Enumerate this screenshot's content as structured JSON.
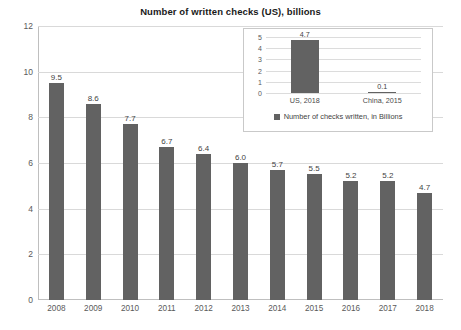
{
  "chart_data": {
    "type": "bar",
    "title": "Number of written checks (US), billions",
    "xlabel": "",
    "ylabel": "",
    "ylim": [
      0,
      12
    ],
    "yticks": [
      0,
      2,
      4,
      6,
      8,
      10,
      12
    ],
    "grid": true,
    "categories": [
      "2008",
      "2009",
      "2010",
      "2011",
      "2012",
      "2013",
      "2014",
      "2015",
      "2016",
      "2017",
      "2018"
    ],
    "values": [
      9.5,
      8.6,
      7.7,
      6.7,
      6.4,
      6.0,
      5.7,
      5.5,
      5.2,
      5.2,
      4.7
    ],
    "value_labels": [
      "9.5",
      "8.6",
      "7.7",
      "6.7",
      "6.4",
      "6.0",
      "5.7",
      "5.5",
      "5.2",
      "5.2",
      "4.7"
    ],
    "bar_color": "#626262",
    "grid_color": "#d9d9d9",
    "inset": {
      "type": "bar",
      "title": "",
      "ylim": [
        0,
        5
      ],
      "yticks": [
        0,
        1,
        2,
        3,
        4,
        5
      ],
      "grid": true,
      "categories": [
        "US, 2018",
        "China, 2015"
      ],
      "values": [
        4.7,
        0.1
      ],
      "value_labels": [
        "4.7",
        "0.1"
      ],
      "legend": {
        "position": "bottom",
        "entries": [
          "Number of checks written, in Billions"
        ]
      },
      "bar_color": "#626262"
    }
  }
}
